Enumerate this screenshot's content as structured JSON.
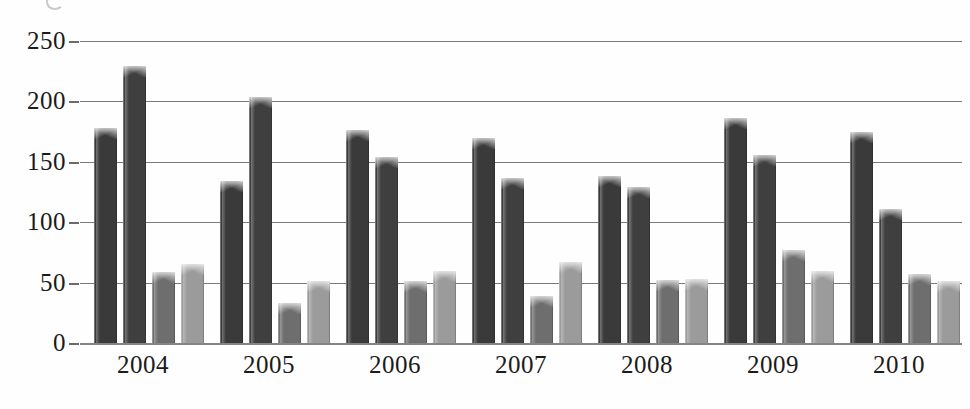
{
  "chart_data": {
    "type": "bar",
    "title": "",
    "subtitle": "",
    "xlabel": "",
    "ylabel": "",
    "categories": [
      "2004",
      "2005",
      "2006",
      "2007",
      "2008",
      "2009",
      "2010"
    ],
    "ylim": [
      0,
      250
    ],
    "yticks": [
      0,
      50,
      100,
      150,
      200,
      250
    ],
    "ytick_labels": [
      "0",
      "50",
      "100",
      "150",
      "200",
      "250"
    ],
    "grid": true,
    "grid_axis": "y",
    "legend": false,
    "legend_position": "none",
    "series": [
      {
        "name": "Series 1",
        "color": "#3a3a3a",
        "values": [
          178,
          134,
          176,
          170,
          138,
          186,
          175
        ]
      },
      {
        "name": "Series 2",
        "color": "#3f3f3f",
        "values": [
          229,
          204,
          154,
          137,
          129,
          156,
          111
        ]
      },
      {
        "name": "Series 3",
        "color": "#6e6e6e",
        "values": [
          59,
          33,
          51,
          39,
          52,
          77,
          57
        ]
      },
      {
        "name": "Series 4",
        "color": "#9b9b9b",
        "values": [
          65,
          51,
          60,
          67,
          53,
          60,
          51
        ]
      }
    ]
  },
  "style": {
    "background": "#ffffff",
    "gridline_color": "#6f6f6f",
    "axis_text_color": "#1b1b1b",
    "baseline_color": "#7a7a7a"
  }
}
